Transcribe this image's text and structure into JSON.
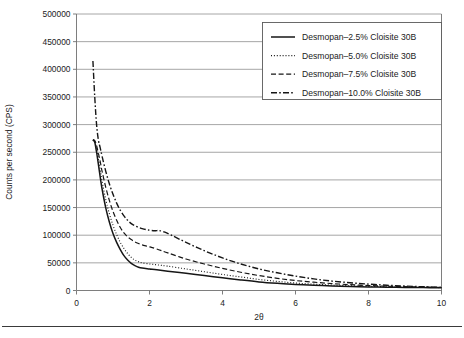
{
  "chart_data": {
    "type": "line",
    "title": "",
    "xlabel": "2θ",
    "ylabel": "Counts per second (CPS)",
    "xlim": [
      0,
      10
    ],
    "ylim": [
      0,
      500000
    ],
    "xticks": [
      0,
      2,
      4,
      6,
      8,
      10
    ],
    "xtick_labels": [
      "0",
      "2",
      "4",
      "6",
      "8",
      "10"
    ],
    "yticks": [
      0,
      50000,
      100000,
      150000,
      200000,
      250000,
      300000,
      350000,
      400000,
      450000,
      500000
    ],
    "ytick_labels": [
      "0",
      "50000",
      "100000",
      "150000",
      "200000",
      "250000",
      "300000",
      "350000",
      "400000",
      "450000",
      "500000"
    ],
    "grid": "horizontal",
    "legend_position": "top-right",
    "series": [
      {
        "name": "Desmopan–2.5% Cloisite 30B",
        "style": "solid",
        "x": [
          0.45,
          0.5,
          0.55,
          0.6,
          0.65,
          0.7,
          0.8,
          0.9,
          1.0,
          1.1,
          1.2,
          1.3,
          1.4,
          1.5,
          1.6,
          1.7,
          1.8,
          2.0,
          2.2,
          2.5,
          3.0,
          3.5,
          4.0,
          4.5,
          5.0,
          5.5,
          6.0,
          6.5,
          7.0,
          7.5,
          8.0,
          8.5,
          9.0,
          9.5,
          10.0
        ],
        "y": [
          272000,
          268000,
          250000,
          228000,
          205000,
          184000,
          150000,
          124000,
          103000,
          87000,
          74000,
          63000,
          55000,
          49000,
          45000,
          42000,
          40500,
          39000,
          37500,
          35000,
          31000,
          27000,
          23000,
          19000,
          15500,
          13000,
          11000,
          9500,
          8200,
          7200,
          6500,
          6000,
          5600,
          5300,
          5000
        ]
      },
      {
        "name": "Desmopan–5.0% Cloisite 30B",
        "style": "dotted",
        "x": [
          0.45,
          0.5,
          0.55,
          0.6,
          0.65,
          0.7,
          0.8,
          0.9,
          1.0,
          1.1,
          1.2,
          1.3,
          1.4,
          1.5,
          1.6,
          1.7,
          1.8,
          2.0,
          2.2,
          2.5,
          3.0,
          3.5,
          4.0,
          4.5,
          5.0,
          5.5,
          6.0,
          6.5,
          7.0,
          7.5,
          8.0,
          8.5,
          9.0,
          9.5,
          10.0
        ],
        "y": [
          272000,
          269000,
          256000,
          238000,
          218000,
          198000,
          165000,
          139000,
          118000,
          101000,
          87000,
          76000,
          67000,
          60000,
          55000,
          52000,
          50000,
          48000,
          46500,
          44000,
          39000,
          34000,
          29000,
          24500,
          20000,
          16500,
          13500,
          11500,
          9800,
          8500,
          7500,
          6800,
          6200,
          5700,
          5200
        ]
      },
      {
        "name": "Desmopan–7.5% Cloisite 30B",
        "style": "dashed",
        "x": [
          0.45,
          0.5,
          0.55,
          0.6,
          0.65,
          0.7,
          0.8,
          0.9,
          1.0,
          1.1,
          1.2,
          1.3,
          1.4,
          1.5,
          1.6,
          1.7,
          1.8,
          2.0,
          2.2,
          2.5,
          3.0,
          3.5,
          4.0,
          4.5,
          5.0,
          5.5,
          6.0,
          6.5,
          7.0,
          7.5,
          8.0,
          8.5,
          9.0,
          9.5,
          10.0
        ],
        "y": [
          273000,
          271000,
          262000,
          248000,
          233000,
          216000,
          187000,
          163000,
          143000,
          127000,
          114000,
          104000,
          97000,
          92000,
          88000,
          85000,
          82500,
          79000,
          75000,
          68000,
          57000,
          48000,
          40000,
          33000,
          27000,
          22000,
          18000,
          15000,
          12500,
          10500,
          9000,
          7800,
          6900,
          6200,
          5500
        ]
      },
      {
        "name": "Desmopan–10.0% Cloisite 30B",
        "style": "dashdot",
        "x": [
          0.45,
          0.5,
          0.55,
          0.6,
          0.65,
          0.7,
          0.8,
          0.9,
          1.0,
          1.1,
          1.2,
          1.3,
          1.4,
          1.5,
          1.6,
          1.8,
          2.0,
          2.15,
          2.25,
          2.4,
          2.6,
          3.0,
          3.5,
          4.0,
          4.5,
          5.0,
          5.5,
          6.0,
          6.5,
          7.0,
          7.5,
          8.0,
          8.5,
          9.0,
          9.5,
          10.0
        ],
        "y": [
          415000,
          350000,
          300000,
          272000,
          258000,
          243000,
          216000,
          193000,
          174000,
          158000,
          145000,
          135000,
          127000,
          121000,
          117000,
          112000,
          109000,
          108000,
          108500,
          106000,
          100000,
          87000,
          72000,
          59000,
          48000,
          39000,
          32000,
          26000,
          21000,
          17000,
          14000,
          11500,
          9500,
          8000,
          6800,
          5800
        ]
      }
    ]
  }
}
